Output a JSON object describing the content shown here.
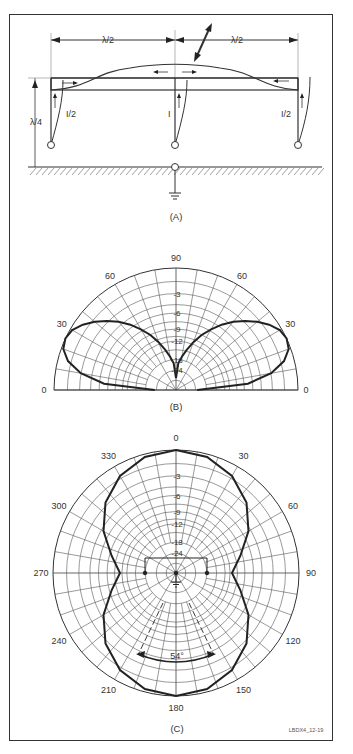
{
  "figure_id": "LBDX4_12-19",
  "panel_a": {
    "caption": "(A)",
    "span_left_label": "λ/2",
    "span_right_label": "λ/2",
    "height_label": "λ/4",
    "current_left_label": "I/2",
    "current_center_label": "I",
    "current_right_label": "I/2"
  },
  "panel_b": {
    "caption": "(B)",
    "angle_labels": [
      {
        "text": "90",
        "deg": 90
      },
      {
        "text": "60",
        "deg": 120
      },
      {
        "text": "60",
        "deg": 60
      },
      {
        "text": "30",
        "deg": 150
      },
      {
        "text": "30",
        "deg": 30
      },
      {
        "text": "0",
        "deg": 180
      },
      {
        "text": "0",
        "deg": 0
      }
    ],
    "db_labels": [
      "-3",
      "-6",
      "-9",
      "-12",
      "-18",
      "-24"
    ]
  },
  "panel_c": {
    "caption": "(C)",
    "angle_labels": [
      {
        "text": "0",
        "deg": 0
      },
      {
        "text": "30",
        "deg": 30
      },
      {
        "text": "60",
        "deg": 60
      },
      {
        "text": "90",
        "deg": 90
      },
      {
        "text": "120",
        "deg": 120
      },
      {
        "text": "150",
        "deg": 150
      },
      {
        "text": "180",
        "deg": 180
      },
      {
        "text": "210",
        "deg": 210
      },
      {
        "text": "240",
        "deg": 240
      },
      {
        "text": "270",
        "deg": 270
      },
      {
        "text": "300",
        "deg": 300
      },
      {
        "text": "330",
        "deg": 330
      }
    ],
    "db_labels": [
      "-3",
      "-6",
      "-9",
      "-12",
      "-18",
      "-24"
    ],
    "beamwidth_label": "54°"
  },
  "chart_data": [
    {
      "type": "polar",
      "title": "(B) Elevation pattern",
      "angle_unit": "degrees elevation",
      "theta": [
        0,
        5,
        10,
        15,
        20,
        25,
        30,
        35,
        40,
        45,
        50,
        55,
        60,
        65,
        70,
        75,
        80,
        85,
        90
      ],
      "r_db": [
        -30,
        -9,
        -4,
        -1.5,
        -0.3,
        0,
        -0.3,
        -1.2,
        -2.4,
        -3.8,
        -5.4,
        -7.3,
        -9.5,
        -12,
        -15,
        -18.5,
        -22,
        -26,
        -40
      ],
      "rings_db": [
        0,
        -3,
        -6,
        -9,
        -12,
        -18,
        -24
      ],
      "half_plane": true,
      "peak_elevation_deg": 25
    },
    {
      "type": "polar",
      "title": "(C) Azimuth pattern",
      "angle_unit": "degrees azimuth",
      "theta": [
        0,
        15,
        30,
        45,
        60,
        75,
        90,
        105,
        120,
        135,
        150,
        165,
        180
      ],
      "r_db": [
        0,
        -0.4,
        -1.6,
        -3.6,
        -6.6,
        -10.5,
        -13.5,
        -10.5,
        -6.6,
        -3.6,
        -1.6,
        -0.4,
        0
      ],
      "symmetry": "mirror about 0-180 axis",
      "rings_db": [
        0,
        -3,
        -6,
        -9,
        -12,
        -18,
        -24
      ],
      "beamwidth_deg": 54
    }
  ],
  "colors": {
    "line": "#222222",
    "grid": "#555555",
    "frame": "#333333",
    "background": "#ffffff"
  }
}
